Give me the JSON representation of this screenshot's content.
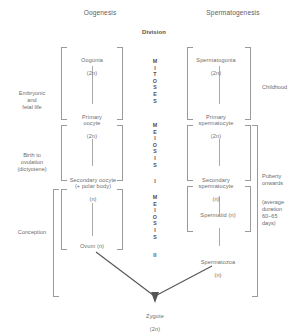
{
  "headers": {
    "left_column": "Oogenesis",
    "right_column": "Spermatogenesis",
    "center_column": "Division"
  },
  "center_column": {
    "mitosis_label": "MITOSES",
    "meiosis_one_label": "MEIOSIS",
    "meiosis_one_numeral": "I",
    "meiosis_two_label": "MEIOSIS",
    "meiosis_two_numeral": "II"
  },
  "timeline_left": [
    {
      "id": "embryonic",
      "text": "Embryonic\nand\nfetal life"
    },
    {
      "id": "birth-to-ovulation",
      "text": "Birth to\novulation\n(dictyotene)"
    },
    {
      "id": "conception",
      "text": "Conception"
    }
  ],
  "timeline_right": [
    {
      "id": "childhood",
      "text": "Childhood"
    },
    {
      "id": "puberty",
      "text": "Puberty\nonwards"
    },
    {
      "id": "duration",
      "text": "(average\nduration\n60–65\ndays)"
    }
  ],
  "oogenesis_stages": [
    {
      "id": "oogonia",
      "name": "Oogonia",
      "ploidy": "(2n)"
    },
    {
      "id": "primary-oocyte",
      "name": "Primary\noocyte",
      "ploidy": "(2n)"
    },
    {
      "id": "secondary-oocyte",
      "name": "Secondary oocyte\n(+ polar body)",
      "ploidy": "(n)"
    },
    {
      "id": "ovum",
      "name": "Ovum (n)",
      "ploidy": ""
    }
  ],
  "spermatogenesis_stages": [
    {
      "id": "spermatogonia",
      "name": "Spermatogonia",
      "ploidy": "(2n)"
    },
    {
      "id": "primary-spermatocyte",
      "name": "Primary\nspermatocyte",
      "ploidy": "(2n)"
    },
    {
      "id": "secondary-spermatocyte",
      "name": "Secondary\nspermatocyte",
      "ploidy": "(n)"
    },
    {
      "id": "spermatid",
      "name": "Spermatid (n)",
      "ploidy": ""
    },
    {
      "id": "spermatozoa",
      "name": "Spermatozoa",
      "ploidy": "(n)"
    }
  ],
  "product": {
    "name": "Zygote",
    "ploidy": "(2n)"
  },
  "colors": {
    "background": "#ffffff",
    "text": "#6d6d6d",
    "heading_text": "#5e5e5e",
    "bracket_line": "#9a9a9a",
    "connector_line": "#a9a9a9",
    "arrow": "#555555"
  }
}
